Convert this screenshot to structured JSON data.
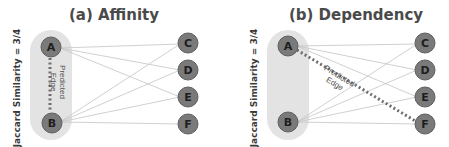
{
  "colors": {
    "node_fill": "#7a7a7a",
    "node_stroke": "#5e5e5e",
    "pill_fill": "#e3e3e3",
    "edge": "#c4c4c4",
    "predicted_edge": "#6e6e6e",
    "text": "#4a4a4a"
  },
  "panels": [
    {
      "title": "(a) Affinity",
      "side_label": "Jaccard Similarity = 3/4",
      "predicted_label_line1": "Predicted",
      "predicted_label_line2": "Edge",
      "left_nodes": [
        "A",
        "B"
      ],
      "right_nodes": [
        "C",
        "D",
        "E",
        "F"
      ],
      "edges": [
        [
          "A",
          "C"
        ],
        [
          "A",
          "D"
        ],
        [
          "A",
          "E"
        ],
        [
          "B",
          "C"
        ],
        [
          "B",
          "D"
        ],
        [
          "B",
          "E"
        ],
        [
          "B",
          "F"
        ]
      ],
      "predicted_edge": [
        "A",
        "B"
      ]
    },
    {
      "title": "(b) Dependency",
      "side_label": "Jaccard Similarity = 3/4",
      "predicted_label_line1": "Predicted",
      "predicted_label_line2": "Edge",
      "left_nodes": [
        "A",
        "B"
      ],
      "right_nodes": [
        "C",
        "D",
        "E",
        "F"
      ],
      "edges": [
        [
          "A",
          "C"
        ],
        [
          "A",
          "D"
        ],
        [
          "A",
          "E"
        ],
        [
          "B",
          "C"
        ],
        [
          "B",
          "D"
        ],
        [
          "B",
          "E"
        ],
        [
          "B",
          "F"
        ]
      ],
      "predicted_edge": [
        "A",
        "F"
      ]
    }
  ]
}
